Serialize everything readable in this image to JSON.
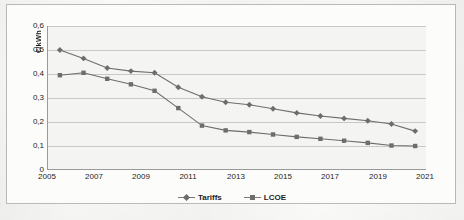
{
  "chart_data": {
    "type": "line",
    "title": "",
    "xlabel": "",
    "ylabel": "€/kWh",
    "xlim": [
      2005,
      2021
    ],
    "ylim": [
      0,
      0.6
    ],
    "grid": true,
    "legend_position": "bottom",
    "x_ticks": [
      "2005",
      "2007",
      "2009",
      "2011",
      "2013",
      "2015",
      "2017",
      "2019",
      "2021"
    ],
    "y_ticks": [
      "0",
      "0,1",
      "0,2",
      "0,3",
      "0,4",
      "0,5",
      "0,6"
    ],
    "x": [
      2005.5,
      2006.5,
      2007.5,
      2008.5,
      2009.5,
      2010.5,
      2011.5,
      2012.5,
      2013.5,
      2014.5,
      2015.5,
      2016.5,
      2017.5,
      2018.5,
      2019.5,
      2020.5
    ],
    "series": [
      {
        "name": "Tariffs",
        "marker": "diamond",
        "color": "#6d6d6d",
        "values": [
          0.5,
          0.465,
          0.425,
          0.412,
          0.405,
          0.345,
          0.305,
          0.282,
          0.272,
          0.255,
          0.238,
          0.225,
          0.215,
          0.205,
          0.192,
          0.162
        ]
      },
      {
        "name": "LCOE",
        "marker": "square",
        "color": "#6d6d6d",
        "values": [
          0.395,
          0.405,
          0.38,
          0.357,
          0.33,
          0.258,
          0.185,
          0.165,
          0.158,
          0.148,
          0.138,
          0.13,
          0.122,
          0.113,
          0.102,
          0.1
        ]
      }
    ]
  },
  "legend": {
    "items": [
      {
        "label": "Tariffs",
        "marker": "diamond"
      },
      {
        "label": "LCOE",
        "marker": "square"
      }
    ]
  }
}
